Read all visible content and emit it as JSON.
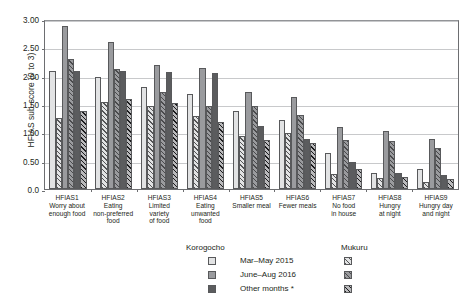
{
  "chart_data": {
    "type": "bar",
    "title": "",
    "xlabel": "",
    "ylabel": "HFIAS sub-score (0 to 3)",
    "ylim": [
      0,
      3
    ],
    "yticks": [
      "0.0",
      "0.50",
      "1.00",
      "1.50",
      "2.00",
      "2.50",
      "3.00"
    ],
    "ytick_values": [
      0,
      0.5,
      1.0,
      1.5,
      2.0,
      2.5,
      3.0
    ],
    "grid": true,
    "legend_position": "bottom",
    "categories": [
      {
        "code": "HFIAS1",
        "desc": "Worry about\nenough food"
      },
      {
        "code": "HFIAS2",
        "desc": "Eating\nnon-preferred\nfood"
      },
      {
        "code": "HFIAS3",
        "desc": "Limited\nvariety\nof food"
      },
      {
        "code": "HFIAS4",
        "desc": "Eating\nunwanted\nfood"
      },
      {
        "code": "HFIAS5",
        "desc": "Smaller meal"
      },
      {
        "code": "HFIAS6",
        "desc": "Fewer meals"
      },
      {
        "code": "HFIAS7",
        "desc": "No food\nin house"
      },
      {
        "code": "HFIAS8",
        "desc": "Hungry\nat night"
      },
      {
        "code": "HFIAS9",
        "desc": "Hungry day\nand night"
      }
    ],
    "series": [
      {
        "name": "Korogocho Mar-May 2015",
        "site": "Korogocho",
        "period": "Mar-May 2015",
        "fill": "#e2e3e4",
        "hatch": false,
        "values": [
          2.08,
          1.98,
          1.8,
          1.67,
          1.37,
          1.21,
          0.64,
          0.28,
          0.35
        ]
      },
      {
        "name": "Mukuru Mar-May 2015",
        "site": "Mukuru",
        "period": "Mar-May 2015",
        "fill": "#e2e3e4",
        "hatch": true,
        "values": [
          1.26,
          1.54,
          1.46,
          1.29,
          0.93,
          0.99,
          0.26,
          0.19,
          0.13
        ]
      },
      {
        "name": "Korogocho June-Aug 2016",
        "site": "Korogocho",
        "period": "June-Aug 2016",
        "fill": "#9a9b9e",
        "hatch": false,
        "values": [
          2.88,
          2.59,
          2.18,
          2.14,
          1.71,
          1.62,
          1.1,
          1.03,
          0.89
        ]
      },
      {
        "name": "Mukuru June-Aug 2016",
        "site": "Mukuru",
        "period": "June-Aug 2016",
        "fill": "#9a9b9e",
        "hatch": true,
        "values": [
          2.3,
          2.12,
          1.72,
          1.46,
          1.47,
          1.31,
          0.86,
          0.84,
          0.72
        ]
      },
      {
        "name": "Korogocho Other months *",
        "site": "Korogocho",
        "period": "Other months *",
        "fill": "#5b5c5e",
        "hatch": false,
        "values": [
          2.08,
          2.08,
          2.07,
          2.04,
          1.11,
          0.89,
          0.47,
          0.29,
          0.25
        ]
      },
      {
        "name": "Mukuru Other months *",
        "site": "Mukuru",
        "period": "Other months *",
        "fill": "#5b5c5e",
        "hatch": true,
        "values": [
          1.38,
          1.59,
          1.52,
          1.19,
          0.86,
          0.82,
          0.36,
          0.22,
          0.18
        ]
      }
    ],
    "legend": {
      "columns": [
        "Korogocho",
        "Mukuru"
      ],
      "rows": [
        "Mar–May 2015",
        "June–Aug 2016",
        "Other months *"
      ]
    }
  }
}
